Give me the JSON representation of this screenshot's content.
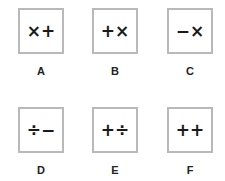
{
  "options": [
    {
      "label": "A",
      "symbols": "×+"
    },
    {
      "label": "B",
      "symbols": "+×"
    },
    {
      "label": "C",
      "symbols": "−×"
    },
    {
      "label": "D",
      "symbols": "÷−"
    },
    {
      "label": "E",
      "symbols": "+÷"
    },
    {
      "label": "F",
      "symbols": "++"
    }
  ]
}
